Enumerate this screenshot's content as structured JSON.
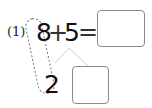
{
  "problem": {
    "label": "(1)",
    "first_operand": "8",
    "operator": "+",
    "second_operand": "5",
    "equals": "=",
    "answer_box_value": "",
    "decomposition": {
      "left_part": "2",
      "right_part_box_value": ""
    }
  },
  "colors": {
    "text": "#111111",
    "box_border": "#8a8a8a",
    "branch_lines": "#cccccc",
    "dashed_loop": "#777777"
  }
}
